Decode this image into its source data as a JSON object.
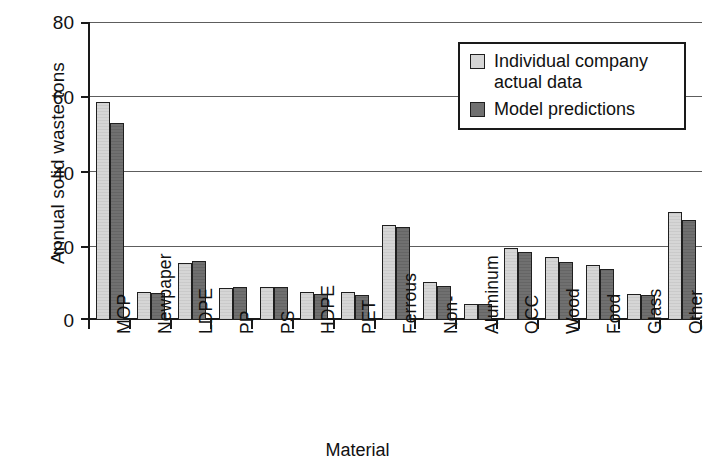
{
  "chart_data": {
    "type": "bar",
    "title": "",
    "xlabel": "Material",
    "ylabel": "Annual solid waste tons",
    "ylim": [
      0,
      80
    ],
    "yticks": [
      0,
      20,
      40,
      60,
      80
    ],
    "grid": true,
    "legend_position": "top-right",
    "categories": [
      "MOP",
      "Newpaper",
      "LDPE",
      "PP",
      "PS",
      "HDPE",
      "PET",
      "Ferrous",
      "Non-",
      "Aluminum",
      "OCC",
      "Wood",
      "Food",
      "Glass",
      "Other"
    ],
    "series": [
      {
        "name": "Individual company actual data",
        "color": "#d6d6d6",
        "values": [
          58.6,
          7.5,
          15.3,
          8.5,
          8.8,
          7.4,
          7.4,
          25.6,
          10.3,
          4.3,
          19.4,
          16.8,
          14.8,
          6.9,
          28.9
        ]
      },
      {
        "name": "Model predictions",
        "color": "#707070",
        "values": [
          52.9,
          7.2,
          15.8,
          8.8,
          8.8,
          7.1,
          6.8,
          25.1,
          9.0,
          4.3,
          18.3,
          15.5,
          13.6,
          6.7,
          26.9
        ]
      }
    ]
  },
  "legend": {
    "entries": [
      {
        "label": "Individual company actual data",
        "swatch": "light-gray-swatch"
      },
      {
        "label": "Model predictions",
        "swatch": "dark-gray-swatch"
      }
    ]
  },
  "axes": {
    "y_title": "Annual solid waste tons",
    "x_title": "Material",
    "y_ticklabels": [
      "80",
      "60",
      "40",
      "20",
      "0"
    ]
  },
  "colors": {
    "series_light": "#d6d6d6",
    "series_dark": "#707070",
    "axis": "#1a1a1a",
    "grid": "#5d5d5d",
    "background": "#ffffff"
  },
  "caption_sliver": "-----  ------- ----"
}
